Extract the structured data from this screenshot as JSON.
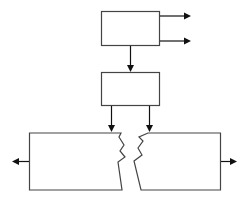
{
  "diagram": {
    "type": "block-flow",
    "colors": {
      "stroke": "#444444",
      "arrow": "#111111",
      "background": "#ffffff"
    },
    "nodes": [
      {
        "id": "top-box",
        "label": ""
      },
      {
        "id": "middle-box",
        "label": ""
      },
      {
        "id": "bottom-left-box",
        "label": "",
        "edge": "broken-right"
      },
      {
        "id": "bottom-right-box",
        "label": "",
        "edge": "broken-left"
      }
    ],
    "edges": [
      {
        "from": "top-box",
        "to": "output-right-1"
      },
      {
        "from": "top-box",
        "to": "output-right-2"
      },
      {
        "from": "top-box",
        "to": "middle-box"
      },
      {
        "from": "middle-box",
        "to": "bottom-left-box"
      },
      {
        "from": "middle-box",
        "to": "bottom-right-box"
      },
      {
        "from": "bottom-left-box",
        "to": "output-left"
      },
      {
        "from": "bottom-right-box",
        "to": "output-right-3"
      }
    ]
  }
}
